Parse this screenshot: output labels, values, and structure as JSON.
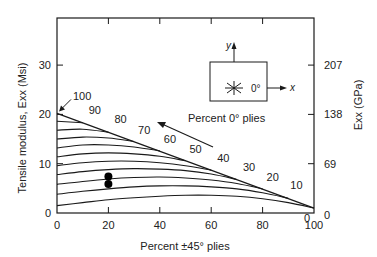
{
  "chart_data": {
    "type": "line",
    "title": "",
    "xlabel": "Percent ±45° plies",
    "ylabel_left": "Tensile modulus, E_xx (Msi)",
    "ylabel_right": "E_xx (GPa)",
    "xlim": [
      0,
      100
    ],
    "ylim": [
      0,
      38
    ],
    "x_ticks": [
      0,
      20,
      40,
      60,
      80,
      100
    ],
    "y_ticks_left": [
      0,
      10,
      20,
      30
    ],
    "y_ticks_right": [
      {
        "label": "0",
        "msi": 0
      },
      {
        "label": "69",
        "msi": 10
      },
      {
        "label": "138",
        "msi": 20
      },
      {
        "label": "207",
        "msi": 30
      }
    ],
    "grid": false,
    "boundary_line": {
      "label": "Percent 0° plies",
      "points": [
        [
          0,
          20.2
        ],
        [
          100,
          1.0
        ]
      ],
      "annotations": [
        {
          "text": "100",
          "x": 0,
          "y": 20.2
        },
        {
          "text": "90",
          "x": 10,
          "y": 18.3
        },
        {
          "text": "80",
          "x": 20,
          "y": 16.4
        },
        {
          "text": "70",
          "x": 30,
          "y": 14.5
        },
        {
          "text": "60",
          "x": 40,
          "y": 12.6
        },
        {
          "text": "50",
          "x": 50,
          "y": 10.6
        },
        {
          "text": "40",
          "x": 60,
          "y": 8.7
        },
        {
          "text": "30",
          "x": 70,
          "y": 6.8
        },
        {
          "text": "20",
          "x": 80,
          "y": 4.9
        },
        {
          "text": "10",
          "x": 90,
          "y": 3.0
        },
        {
          "text": "0",
          "x": 100,
          "y": 1.0
        }
      ]
    },
    "series": [
      {
        "name": "90% 0°",
        "x": [
          0,
          10
        ],
        "y": [
          18.6,
          18.3
        ]
      },
      {
        "name": "80% 0°",
        "x": [
          0,
          10,
          20
        ],
        "y": [
          16.8,
          17.0,
          16.4
        ]
      },
      {
        "name": "70% 0°",
        "x": [
          0,
          10,
          20,
          30
        ],
        "y": [
          15.0,
          15.4,
          15.2,
          14.5
        ]
      },
      {
        "name": "60% 0°",
        "x": [
          0,
          10,
          20,
          30,
          40
        ],
        "y": [
          13.2,
          13.8,
          13.8,
          13.4,
          12.6
        ]
      },
      {
        "name": "50% 0°",
        "x": [
          0,
          10,
          20,
          30,
          40,
          50
        ],
        "y": [
          11.4,
          12.0,
          12.2,
          12.0,
          11.5,
          10.6
        ]
      },
      {
        "name": "40% 0°",
        "x": [
          0,
          10,
          20,
          30,
          40,
          50,
          60
        ],
        "y": [
          9.6,
          10.2,
          10.5,
          10.5,
          10.2,
          9.6,
          8.7
        ]
      },
      {
        "name": "30% 0°",
        "x": [
          0,
          10,
          20,
          30,
          40,
          50,
          60,
          70
        ],
        "y": [
          7.8,
          8.4,
          8.8,
          9.0,
          8.9,
          8.6,
          7.9,
          6.8
        ]
      },
      {
        "name": "20% 0°",
        "x": [
          0,
          10,
          20,
          30,
          40,
          50,
          60,
          70,
          80
        ],
        "y": [
          5.8,
          6.4,
          6.9,
          7.2,
          7.3,
          7.1,
          6.7,
          6.0,
          4.9
        ]
      },
      {
        "name": "10% 0°",
        "x": [
          0,
          10,
          20,
          30,
          40,
          50,
          60,
          70,
          80,
          90
        ],
        "y": [
          3.8,
          4.4,
          4.9,
          5.3,
          5.5,
          5.5,
          5.3,
          4.9,
          4.1,
          3.0
        ]
      },
      {
        "name": "0% 0°",
        "x": [
          0,
          10,
          20,
          30,
          40,
          50,
          60,
          70,
          80,
          90,
          100
        ],
        "y": [
          1.5,
          2.1,
          2.7,
          3.1,
          3.4,
          3.6,
          3.6,
          3.4,
          2.9,
          2.1,
          1.0
        ]
      }
    ],
    "markers": [
      {
        "x": 20,
        "y": 7.4
      },
      {
        "x": 20,
        "y": 5.9
      }
    ],
    "inset": {
      "axis_y_label": "y",
      "axis_x_label": "x",
      "angle_label": "0°"
    }
  }
}
